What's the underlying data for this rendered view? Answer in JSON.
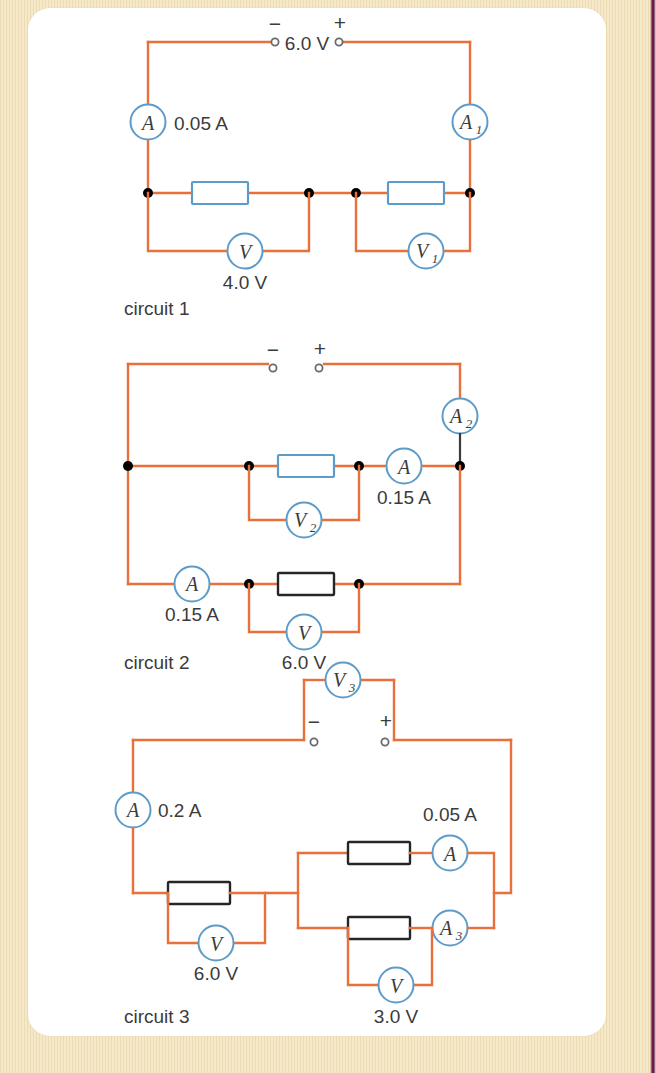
{
  "page": {
    "background_color": "#f6e9c9",
    "paper_color": "#ffffff",
    "edge_rule_color": "#7a2050"
  },
  "palette": {
    "wire": "#e8703a",
    "meter_outline": "#5d9cc9",
    "resistor_blue": "#5d9cc9",
    "resistor_black": "#262626",
    "node": "#000000",
    "text": "#3b3b3b"
  },
  "circuits": [
    {
      "id": "circuit-1",
      "caption": "circuit 1",
      "supply": {
        "label": "6.0 V",
        "negative": "−",
        "positive": "+"
      },
      "meters": [
        {
          "name": "ammeter-a",
          "symbol": "A",
          "subscript": "",
          "reading": "0.05 A"
        },
        {
          "name": "ammeter-a1",
          "symbol": "A",
          "subscript": "1",
          "reading": ""
        },
        {
          "name": "voltmeter-v",
          "symbol": "V",
          "subscript": "",
          "reading": "4.0 V"
        },
        {
          "name": "voltmeter-v1",
          "symbol": "V",
          "subscript": "1",
          "reading": ""
        }
      ],
      "resistors": [
        {
          "name": "resistor-left",
          "style": "blue"
        },
        {
          "name": "resistor-right",
          "style": "blue"
        }
      ]
    },
    {
      "id": "circuit-2",
      "caption": "circuit 2",
      "supply": {
        "label": "",
        "negative": "−",
        "positive": "+"
      },
      "meters": [
        {
          "name": "ammeter-a2",
          "symbol": "A",
          "subscript": "2",
          "reading": ""
        },
        {
          "name": "ammeter-a-upper",
          "symbol": "A",
          "subscript": "",
          "reading": "0.15 A"
        },
        {
          "name": "ammeter-a-lower",
          "symbol": "A",
          "subscript": "",
          "reading": "0.15 A"
        },
        {
          "name": "voltmeter-v2",
          "symbol": "V",
          "subscript": "2",
          "reading": ""
        },
        {
          "name": "voltmeter-v",
          "symbol": "V",
          "subscript": "",
          "reading": "6.0 V"
        }
      ],
      "resistors": [
        {
          "name": "resistor-upper",
          "style": "blue"
        },
        {
          "name": "resistor-lower",
          "style": "black"
        }
      ]
    },
    {
      "id": "circuit-3",
      "caption": "circuit 3",
      "supply": {
        "label": "",
        "negative": "−",
        "positive": "+"
      },
      "meters": [
        {
          "name": "voltmeter-v3",
          "symbol": "V",
          "subscript": "3",
          "reading": ""
        },
        {
          "name": "ammeter-a-left",
          "symbol": "A",
          "subscript": "",
          "reading": "0.2 A"
        },
        {
          "name": "ammeter-a-top",
          "symbol": "A",
          "subscript": "",
          "reading": "0.05 A"
        },
        {
          "name": "ammeter-a3",
          "symbol": "A",
          "subscript": "3",
          "reading": ""
        },
        {
          "name": "voltmeter-v-left",
          "symbol": "V",
          "subscript": "",
          "reading": "6.0 V"
        },
        {
          "name": "voltmeter-v-bottom",
          "symbol": "V",
          "subscript": "",
          "reading": "3.0 V"
        }
      ],
      "resistors": [
        {
          "name": "resistor-left",
          "style": "black"
        },
        {
          "name": "resistor-top",
          "style": "black"
        },
        {
          "name": "resistor-bottom",
          "style": "black"
        }
      ]
    }
  ],
  "labels": {
    "c1_supply": "6.0 V",
    "c1_minus": "−",
    "c1_plus": "+",
    "c1_a_reading": "0.05 A",
    "c1_a_sym": "A",
    "c1_a1_sym": "A",
    "c1_a1_sub": "1",
    "c1_v_sym": "V",
    "c1_v_reading": "4.0 V",
    "c1_v1_sym": "V",
    "c1_v1_sub": "1",
    "c1_caption": "circuit 1",
    "c2_minus": "−",
    "c2_plus": "+",
    "c2_a2_sym": "A",
    "c2_a2_sub": "2",
    "c2_a_upper_sym": "A",
    "c2_a_upper_reading": "0.15 A",
    "c2_v2_sym": "V",
    "c2_v2_sub": "2",
    "c2_a_lower_sym": "A",
    "c2_a_lower_reading": "0.15 A",
    "c2_v_sym": "V",
    "c2_v_reading": "6.0 V",
    "c2_caption": "circuit 2",
    "c3_v3_sym": "V",
    "c3_v3_sub": "3",
    "c3_minus": "−",
    "c3_plus": "+",
    "c3_a_left_sym": "A",
    "c3_a_left_reading": "0.2 A",
    "c3_a_top_sym": "A",
    "c3_a_top_reading": "0.05 A",
    "c3_a3_sym": "A",
    "c3_a3_sub": "3",
    "c3_v_left_sym": "V",
    "c3_v_left_reading": "6.0 V",
    "c3_a3b_sym": "A",
    "c3_v_bottom_sym": "V",
    "c3_v_bottom_reading": "3.0 V",
    "c3_caption": "circuit 3"
  }
}
